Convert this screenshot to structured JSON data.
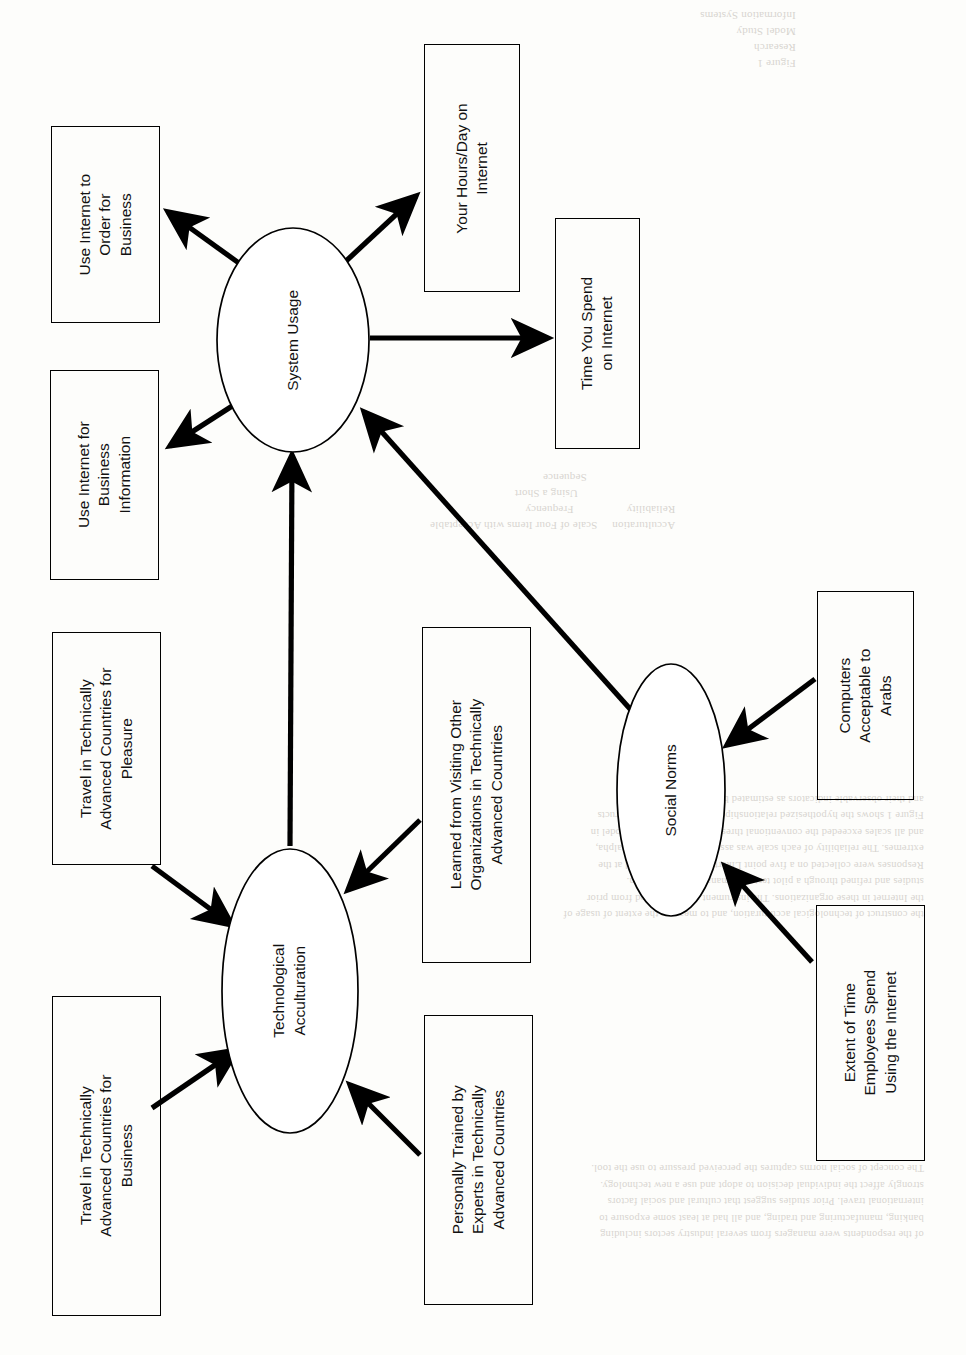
{
  "figure": {
    "type": "research-model-diagram",
    "orientation": "rotated-90-ccw",
    "constructs": [
      {
        "id": "system_usage",
        "label": "System Usage"
      },
      {
        "id": "technological_acculturation",
        "label": "Technological\nAcculturation"
      },
      {
        "id": "social_norms",
        "label": "Social Norms"
      }
    ],
    "indicators": [
      {
        "id": "use_internet_order",
        "label": "Use Internet to\nOrder for\nBusiness",
        "construct": "system_usage",
        "direction": "from-construct"
      },
      {
        "id": "use_internet_info",
        "label": "Use Internet for\nBusiness\nInformation",
        "construct": "system_usage",
        "direction": "from-construct"
      },
      {
        "id": "hours_per_day",
        "label": "Your Hours/Day on\nInternet",
        "construct": "system_usage",
        "direction": "from-construct"
      },
      {
        "id": "time_spent",
        "label": "Time You Spend\non Internet",
        "construct": "system_usage",
        "direction": "from-construct"
      },
      {
        "id": "travel_business",
        "label": "Travel in Technically\nAdvanced Countries for\nBusiness",
        "construct": "technological_acculturation",
        "direction": "to-construct"
      },
      {
        "id": "travel_pleasure",
        "label": "Travel in Technically\nAdvanced Countries for\nPleasure",
        "construct": "technological_acculturation",
        "direction": "to-construct"
      },
      {
        "id": "learned_visiting",
        "label": "Learned from Visiting Other\nOrganizations in Technically\nAdvanced Countries",
        "construct": "technological_acculturation",
        "direction": "to-construct"
      },
      {
        "id": "personally_trained",
        "label": "Personally Trained by\nExperts in Technically\nAdvanced Countries",
        "construct": "technological_acculturation",
        "direction": "to-construct"
      },
      {
        "id": "computers_acceptable",
        "label": "Computers\nAcceptable to\nArabs",
        "construct": "social_norms",
        "direction": "to-construct"
      },
      {
        "id": "extent_of_time",
        "label": "Extent of Time\nEmployees Spend\nUsing the Internet",
        "construct": "social_norms",
        "direction": "to-construct"
      }
    ],
    "paths": [
      {
        "from": "technological_acculturation",
        "to": "system_usage"
      },
      {
        "from": "social_norms",
        "to": "system_usage"
      }
    ],
    "colors": {
      "stroke": "#000000",
      "fill": "#ffffff",
      "background": "#fdfdfb"
    }
  },
  "labels": {
    "system_usage": "System Usage",
    "tech_acc_line1": "Technological",
    "tech_acc_line2": "Acculturation",
    "social_norms": "Social Norms",
    "use_internet_order_1": "Use Internet to",
    "use_internet_order_2": "Order for",
    "use_internet_order_3": "Business",
    "use_internet_info_1": "Use Internet for",
    "use_internet_info_2": "Business",
    "use_internet_info_3": "Information",
    "hours_per_day_1": "Your Hours/Day on",
    "hours_per_day_2": "Internet",
    "time_spent_1": "Time You Spend",
    "time_spent_2": "on Internet",
    "travel_business_1": "Travel in Technically",
    "travel_business_2": "Advanced Countries for",
    "travel_business_3": "Business",
    "travel_pleasure_1": "Travel in Technically",
    "travel_pleasure_2": "Advanced Countries for",
    "travel_pleasure_3": "Pleasure",
    "learned_visiting_1": "Learned from Visiting Other",
    "learned_visiting_2": "Organizations in Technically",
    "learned_visiting_3": "Advanced Countries",
    "personally_trained_1": "Personally Trained by",
    "personally_trained_2": "Experts in Technically",
    "personally_trained_3": "Advanced Countries",
    "computers_acceptable_1": "Computers",
    "computers_acceptable_2": "Acceptable to",
    "computers_acceptable_3": "Arabs",
    "extent_of_time_1": "Extent of Time",
    "extent_of_time_2": "Employees Spend",
    "extent_of_time_3": "Using the Internet"
  }
}
